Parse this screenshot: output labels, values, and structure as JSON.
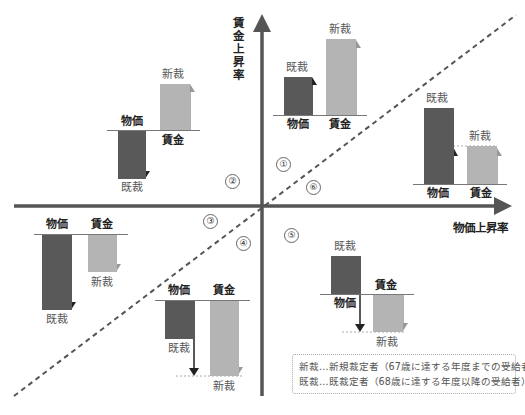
{
  "axes": {
    "y_title": "賃金上昇率",
    "x_title": "物価上昇率",
    "color": "#555555"
  },
  "labels": {
    "kisai": "既裁",
    "shinsai": "新裁",
    "bukka": "物価",
    "chingin": "賃金"
  },
  "regions": [
    "①",
    "②",
    "③",
    "④",
    "⑤",
    "⑥"
  ],
  "colors": {
    "existing_bar": "#595959",
    "new_bar": "#b4b4b4",
    "dark_arrow": "#222222",
    "light_arrow": "#999999"
  },
  "legend": {
    "line1": "新裁…新規裁定者（67歳に達する年度までの受給者）",
    "line2": "既裁…既裁定者（68歳に達する年度以降の受給者）"
  },
  "cases": [
    {
      "region": "①",
      "bukka": "up",
      "chingin": "up",
      "kisai_follows": "物価",
      "shinsai_follows": "賃金"
    },
    {
      "region": "②",
      "bukka": "down",
      "chingin": "up",
      "kisai_follows": "物価",
      "shinsai_follows": "賃金"
    },
    {
      "region": "③",
      "bukka": "down",
      "chingin": "down",
      "kisai_follows": "物価",
      "shinsai_follows": "賃金"
    },
    {
      "region": "④",
      "bukka": "down",
      "chingin": "down",
      "kisai_follows": "賃金",
      "shinsai_follows": "賃金"
    },
    {
      "region": "⑤",
      "bukka": "up",
      "chingin": "down",
      "kisai_follows": "賃金",
      "shinsai_follows": "賃金"
    },
    {
      "region": "⑥",
      "bukka": "up",
      "chingin": "up",
      "kisai_follows": "賃金",
      "shinsai_follows": "賃金"
    }
  ]
}
